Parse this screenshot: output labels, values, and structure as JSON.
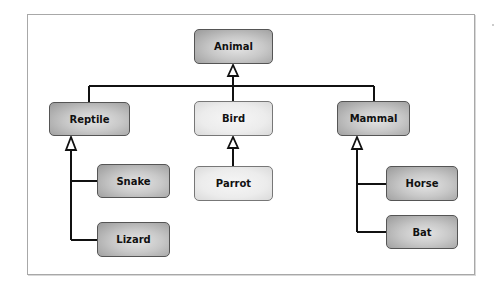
{
  "diagram": {
    "type": "class-hierarchy",
    "nodes": {
      "animal": {
        "label": "Animal",
        "style": "dark"
      },
      "reptile": {
        "label": "Reptile",
        "style": "dark"
      },
      "bird": {
        "label": "Bird",
        "style": "light"
      },
      "mammal": {
        "label": "Mammal",
        "style": "dark"
      },
      "snake": {
        "label": "Snake",
        "style": "dark"
      },
      "lizard": {
        "label": "Lizard",
        "style": "dark"
      },
      "parrot": {
        "label": "Parrot",
        "style": "light"
      },
      "horse": {
        "label": "Horse",
        "style": "dark"
      },
      "bat": {
        "label": "Bat",
        "style": "dark"
      }
    },
    "edges": [
      {
        "from": "Reptile",
        "to": "Animal",
        "arrow": "hollow-triangle"
      },
      {
        "from": "Bird",
        "to": "Animal",
        "arrow": "hollow-triangle"
      },
      {
        "from": "Mammal",
        "to": "Animal",
        "arrow": "hollow-triangle"
      },
      {
        "from": "Snake",
        "to": "Reptile",
        "arrow": "hollow-triangle"
      },
      {
        "from": "Lizard",
        "to": "Reptile",
        "arrow": "hollow-triangle"
      },
      {
        "from": "Parrot",
        "to": "Bird",
        "arrow": "hollow-triangle"
      },
      {
        "from": "Horse",
        "to": "Mammal",
        "arrow": "hollow-triangle"
      },
      {
        "from": "Bat",
        "to": "Mammal",
        "arrow": "hollow-triangle"
      }
    ],
    "colors": {
      "line": "#111111",
      "frame": "#a8a8a8",
      "dark_fill": "#a0a0a0",
      "light_fill": "#ececec"
    }
  }
}
